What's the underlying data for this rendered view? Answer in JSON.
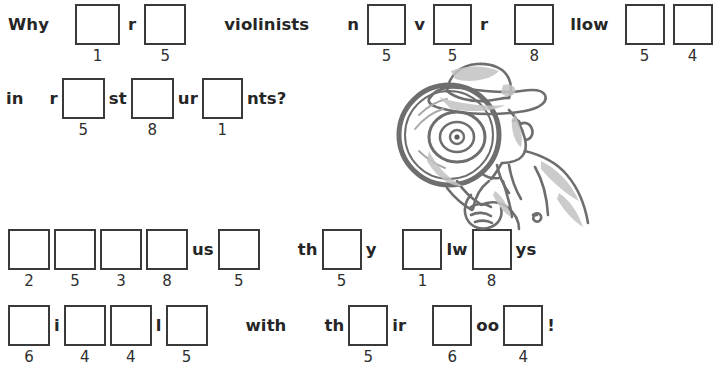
{
  "page": {
    "kind": "puzzle-worksheet",
    "background_color": "#ffffff",
    "ink_color": "#2b2b2b",
    "box_border_color": "#3a3a3a"
  },
  "riddle": {
    "question_lines": [
      {
        "id": "q-line-1",
        "top": 4,
        "left": 8,
        "tokens": [
          {
            "type": "word",
            "text": "Why"
          },
          {
            "type": "gap",
            "size": "l"
          },
          {
            "type": "blank",
            "number": "1",
            "w": 45,
            "h": 41
          },
          {
            "type": "gap",
            "size": "s"
          },
          {
            "type": "word",
            "text": "r"
          },
          {
            "type": "gap",
            "size": "s"
          },
          {
            "type": "blank",
            "number": "5",
            "w": 42,
            "h": 41
          },
          {
            "type": "gap",
            "size": "xl"
          },
          {
            "type": "word",
            "text": "violinists"
          },
          {
            "type": "gap",
            "size": "xl"
          },
          {
            "type": "word",
            "text": "n"
          },
          {
            "type": "gap",
            "size": "s"
          },
          {
            "type": "blank",
            "number": "5",
            "w": 39,
            "h": 41
          },
          {
            "type": "gap",
            "size": "s"
          },
          {
            "type": "word",
            "text": "v"
          },
          {
            "type": "gap",
            "size": "s"
          },
          {
            "type": "blank",
            "number": "5",
            "w": 39,
            "h": 41
          },
          {
            "type": "gap",
            "size": "s"
          },
          {
            "type": "word",
            "text": "r"
          },
          {
            "type": "gap",
            "size": "l"
          },
          {
            "type": "blank",
            "number": "8",
            "w": 40,
            "h": 41
          },
          {
            "type": "gap",
            "size": "m"
          },
          {
            "type": "word",
            "text": "llow"
          },
          {
            "type": "gap",
            "size": "m"
          },
          {
            "type": "blank",
            "number": "5",
            "w": 40,
            "h": 41
          },
          {
            "type": "gap",
            "size": "s"
          },
          {
            "type": "blank",
            "number": "4",
            "w": 40,
            "h": 41
          }
        ]
      },
      {
        "id": "q-line-2",
        "top": 78,
        "left": 6,
        "tokens": [
          {
            "type": "word",
            "text": "in"
          },
          {
            "type": "gap",
            "size": "l"
          },
          {
            "type": "word",
            "text": "r"
          },
          {
            "type": "gap",
            "size": "xs"
          },
          {
            "type": "blank",
            "number": "5",
            "w": 43,
            "h": 41
          },
          {
            "type": "gap",
            "size": "xs"
          },
          {
            "type": "word",
            "text": "st"
          },
          {
            "type": "gap",
            "size": "xs"
          },
          {
            "type": "blank",
            "number": "8",
            "w": 43,
            "h": 41
          },
          {
            "type": "gap",
            "size": "xs"
          },
          {
            "type": "word",
            "text": "ur"
          },
          {
            "type": "gap",
            "size": "xs"
          },
          {
            "type": "blank",
            "number": "1",
            "w": 41,
            "h": 41
          },
          {
            "type": "gap",
            "size": "xs"
          },
          {
            "type": "word",
            "text": "nts?"
          }
        ]
      }
    ],
    "answer_lines": [
      {
        "id": "a-line-1",
        "top": 229,
        "left": 8,
        "tokens": [
          {
            "type": "blank",
            "number": "2",
            "w": 42,
            "h": 41
          },
          {
            "type": "gap",
            "size": "xs"
          },
          {
            "type": "blank",
            "number": "5",
            "w": 42,
            "h": 41
          },
          {
            "type": "gap",
            "size": "xs"
          },
          {
            "type": "blank",
            "number": "3",
            "w": 42,
            "h": 41
          },
          {
            "type": "gap",
            "size": "xs"
          },
          {
            "type": "blank",
            "number": "8",
            "w": 42,
            "h": 41
          },
          {
            "type": "gap",
            "size": "xs"
          },
          {
            "type": "word",
            "text": "us"
          },
          {
            "type": "gap",
            "size": "xs"
          },
          {
            "type": "blank",
            "number": "5",
            "w": 42,
            "h": 41
          },
          {
            "type": "gap",
            "size": "xl"
          },
          {
            "type": "word",
            "text": "th"
          },
          {
            "type": "gap",
            "size": "xs"
          },
          {
            "type": "blank",
            "number": "5",
            "w": 40,
            "h": 41
          },
          {
            "type": "gap",
            "size": "xs"
          },
          {
            "type": "word",
            "text": "y"
          },
          {
            "type": "gap",
            "size": "l"
          },
          {
            "type": "blank",
            "number": "1",
            "w": 40,
            "h": 41
          },
          {
            "type": "gap",
            "size": "xs"
          },
          {
            "type": "word",
            "text": "lw"
          },
          {
            "type": "gap",
            "size": "xs"
          },
          {
            "type": "blank",
            "number": "8",
            "w": 40,
            "h": 41
          },
          {
            "type": "gap",
            "size": "xs"
          },
          {
            "type": "word",
            "text": "ys"
          }
        ]
      },
      {
        "id": "a-line-2",
        "top": 305,
        "left": 8,
        "tokens": [
          {
            "type": "blank",
            "number": "6",
            "w": 42,
            "h": 41
          },
          {
            "type": "gap",
            "size": "xs"
          },
          {
            "type": "word",
            "text": "i"
          },
          {
            "type": "gap",
            "size": "xs"
          },
          {
            "type": "blank",
            "number": "4",
            "w": 42,
            "h": 41
          },
          {
            "type": "gap",
            "size": "xs"
          },
          {
            "type": "blank",
            "number": "4",
            "w": 42,
            "h": 41
          },
          {
            "type": "gap",
            "size": "xs"
          },
          {
            "type": "word",
            "text": "l"
          },
          {
            "type": "gap",
            "size": "xs"
          },
          {
            "type": "blank",
            "number": "5",
            "w": 42,
            "h": 41
          },
          {
            "type": "gap",
            "size": "xl"
          },
          {
            "type": "word",
            "text": "with"
          },
          {
            "type": "gap",
            "size": "xl"
          },
          {
            "type": "word",
            "text": "th"
          },
          {
            "type": "gap",
            "size": "xs"
          },
          {
            "type": "blank",
            "number": "5",
            "w": 40,
            "h": 41
          },
          {
            "type": "gap",
            "size": "xs"
          },
          {
            "type": "word",
            "text": "ir"
          },
          {
            "type": "gap",
            "size": "l"
          },
          {
            "type": "blank",
            "number": "6",
            "w": 40,
            "h": 41
          },
          {
            "type": "gap",
            "size": "xs"
          },
          {
            "type": "word",
            "text": "oo"
          },
          {
            "type": "gap",
            "size": "xs"
          },
          {
            "type": "blank",
            "number": "4",
            "w": 40,
            "h": 41
          },
          {
            "type": "gap",
            "size": "xs"
          },
          {
            "type": "word",
            "text": "!"
          }
        ]
      }
    ]
  },
  "illustration": {
    "name": "detective-with-magnifying-glass",
    "left": 385,
    "top": 55,
    "width": 235,
    "height": 180,
    "ink": "#6e6e6e",
    "shade": "#b9b9b9",
    "shade_dark": "#8c8c8c"
  }
}
